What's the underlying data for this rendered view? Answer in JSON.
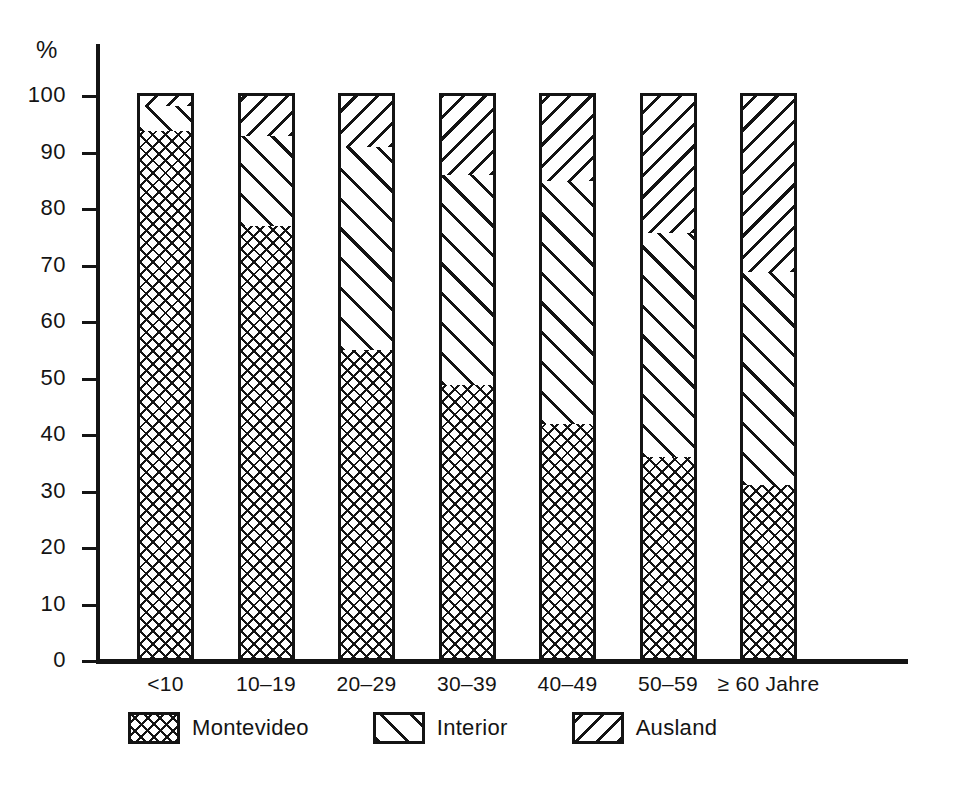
{
  "chart_data": {
    "type": "bar",
    "title": "",
    "subtitle": "",
    "xlabel": "",
    "ylabel": "%",
    "ylim": [
      0,
      100
    ],
    "grid": false,
    "stacked": true,
    "stack_total": 100,
    "legend_position": "bottom",
    "categories": [
      "<10",
      "10–19",
      "20–29",
      "30–39",
      "40–49",
      "50–59",
      "≥ 60 Jahre"
    ],
    "y_ticks": [
      0,
      10,
      20,
      30,
      40,
      50,
      60,
      70,
      80,
      90,
      100
    ],
    "y_tick_labels": [
      "0",
      "10",
      "20",
      "30",
      "40",
      "50",
      "60",
      "70",
      "80",
      "90",
      "100"
    ],
    "series": [
      {
        "name": "Montevideo",
        "pattern": "cross-hatch",
        "values": [
          93.8,
          77.0,
          55.0,
          48.8,
          42.0,
          36.1,
          31.2
        ]
      },
      {
        "name": "Interior",
        "pattern": "diagonal-wide",
        "values": [
          4.4,
          15.9,
          36.0,
          37.2,
          43.0,
          39.7,
          37.6
        ]
      },
      {
        "name": "Ausland",
        "pattern": "diagonal-dense",
        "values": [
          1.8,
          7.1,
          9.0,
          14.0,
          15.0,
          24.2,
          31.2
        ]
      }
    ],
    "cumulative_tops": [
      {
        "category": "<10",
        "montevideo_top": 93.8,
        "interior_top": 98.2,
        "ausland_top": 100
      },
      {
        "category": "10–19",
        "montevideo_top": 77.0,
        "interior_top": 92.9,
        "ausland_top": 100
      },
      {
        "category": "20–29",
        "montevideo_top": 55.0,
        "interior_top": 91.0,
        "ausland_top": 100
      },
      {
        "category": "30–39",
        "montevideo_top": 48.8,
        "interior_top": 86.0,
        "ausland_top": 100
      },
      {
        "category": "40–49",
        "montevideo_top": 42.0,
        "interior_top": 85.0,
        "ausland_top": 100
      },
      {
        "category": "50–59",
        "montevideo_top": 36.1,
        "interior_top": 75.8,
        "ausland_top": 100
      },
      {
        "category": "≥ 60 Jahre",
        "montevideo_top": 31.2,
        "interior_top": 68.8,
        "ausland_top": 100
      }
    ],
    "legend": [
      {
        "label": "Montevideo",
        "pattern": "cross-hatch"
      },
      {
        "label": "Interior",
        "pattern": "diagonal-wide"
      },
      {
        "label": "Ausland",
        "pattern": "diagonal-dense"
      }
    ],
    "colors": {
      "ink": "#141414",
      "background": "#ffffff"
    }
  },
  "axis": {
    "y_label": "%",
    "ticks": [
      "100",
      "90",
      "80",
      "70",
      "60",
      "50",
      "40",
      "30",
      "20",
      "10",
      "0"
    ]
  },
  "x_labels": [
    "<10",
    "10–19",
    "20–29",
    "30–39",
    "40–49",
    "50–59",
    "≥ 60 Jahre"
  ],
  "legend": {
    "items": [
      "Montevideo",
      "Interior",
      "Ausland"
    ]
  }
}
